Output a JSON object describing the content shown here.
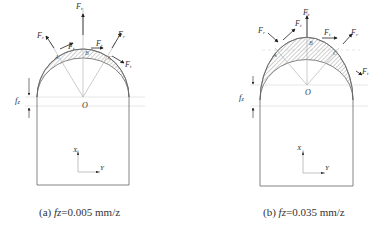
{
  "panels": [
    {
      "id": "a",
      "caption_prefix": "(a) ",
      "caption_var": "fz",
      "caption_value": "=0.005 mm/z",
      "labels": {
        "force_top": "F",
        "force_top_sub": "t",
        "force_left": "F",
        "force_left_sub": "r",
        "force_left_tan": "F",
        "force_left_tan_sub": "t",
        "force_right_tan": "F",
        "force_right_tan_sub": "t",
        "force_right": "F",
        "force_right_sub": "r",
        "force_right_low": "F",
        "force_right_low_sub": "t",
        "point_a": "A",
        "point_b": "B",
        "point_c": "C",
        "center": "O",
        "feed": "f",
        "feed_sub": "z",
        "axis_x": "X",
        "axis_y": "Y"
      }
    },
    {
      "id": "b",
      "caption_prefix": "(b) ",
      "caption_var": "fz",
      "caption_value": "=0.035 mm/z",
      "labels": {
        "force_top": "F",
        "force_top_sub": "t",
        "force_left": "F",
        "force_left_sub": "r",
        "force_left_tan": "F",
        "force_left_tan_sub": "t",
        "force_right_tan": "F",
        "force_right_tan_sub": "t",
        "force_right": "F",
        "force_right_sub": "r",
        "force_right_low": "F",
        "force_right_low_sub": "t",
        "point_a": "A",
        "point_b": "B",
        "point_c": "C",
        "center": "O",
        "feed": "f",
        "feed_sub": "z",
        "axis_x": "X",
        "axis_y": "Y"
      }
    }
  ],
  "colors": {
    "outline": "#666666",
    "hatch": "#888888",
    "arrow": "#222222",
    "guide": "#bbbbbb",
    "text": "#333333"
  }
}
